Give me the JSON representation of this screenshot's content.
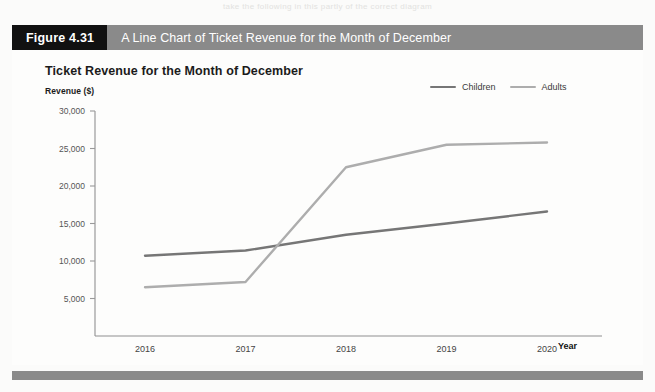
{
  "page": {
    "bleed_text": "take the following in this partly of the correct diagram"
  },
  "figure": {
    "tag": "Figure 4.31",
    "caption": "A Line Chart of Ticket Revenue for the Month of December",
    "tag_bg": "#111111",
    "bar_bg": "#8a8a8a",
    "bar_text_color": "#ffffff"
  },
  "legend": {
    "items": [
      {
        "label": "Children",
        "color": "#767676"
      },
      {
        "label": "Adults",
        "color": "#adadad"
      }
    ]
  },
  "axes": {
    "x_title": "Year",
    "y_title": "Revenue ($)",
    "y_ticks": [
      "5,000",
      "10,000",
      "15,000",
      "20,000",
      "25,000",
      "30,000"
    ],
    "x_ticks": [
      "2016",
      "2017",
      "2018",
      "2019",
      "2020"
    ]
  },
  "chart_data": {
    "type": "line",
    "title": "Ticket Revenue for the Month of December",
    "xlabel": "Year",
    "ylabel": "Revenue ($)",
    "categories": [
      "2016",
      "2017",
      "2018",
      "2019",
      "2020"
    ],
    "series": [
      {
        "name": "Children",
        "color": "#767676",
        "values": [
          10700,
          11400,
          13500,
          15000,
          16600
        ]
      },
      {
        "name": "Adults",
        "color": "#adadad",
        "values": [
          6500,
          7200,
          22500,
          25500,
          25800
        ]
      }
    ],
    "ylim": [
      0,
      30000
    ],
    "ytick_step": 5000,
    "grid": false,
    "legend_position": "top-right"
  }
}
